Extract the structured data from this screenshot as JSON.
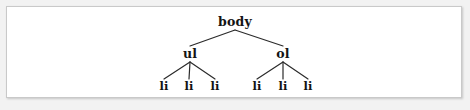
{
  "figure": {
    "title": "",
    "background_color": "#f2f2f2",
    "panel_color": "#ffffff",
    "border_color": "#c9c9c9",
    "edge_color": "#2b2b2b",
    "text_color": "#141414"
  },
  "chart_data": {
    "type": "diagram",
    "diagram_kind": "tree",
    "title": "",
    "nodes": [
      {
        "id": "body",
        "label": "body",
        "level": 0,
        "x": 235,
        "y": 22,
        "parent": null
      },
      {
        "id": "ul",
        "label": "ul",
        "level": 1,
        "x": 190,
        "y": 54,
        "parent": "body"
      },
      {
        "id": "ol",
        "label": "ol",
        "level": 1,
        "x": 283,
        "y": 54,
        "parent": "body"
      },
      {
        "id": "li-u1",
        "label": "li",
        "level": 2,
        "x": 164,
        "y": 87,
        "parent": "ul"
      },
      {
        "id": "li-u2",
        "label": "li",
        "level": 2,
        "x": 189,
        "y": 87,
        "parent": "ul"
      },
      {
        "id": "li-u3",
        "label": "li",
        "level": 2,
        "x": 215,
        "y": 87,
        "parent": "ul"
      },
      {
        "id": "li-o1",
        "label": "li",
        "level": 2,
        "x": 257,
        "y": 87,
        "parent": "ol"
      },
      {
        "id": "li-o2",
        "label": "li",
        "level": 2,
        "x": 283,
        "y": 87,
        "parent": "ol"
      },
      {
        "id": "li-o3",
        "label": "li",
        "level": 2,
        "x": 308,
        "y": 87,
        "parent": "ol"
      }
    ],
    "edges": [
      {
        "from": "body",
        "to": "ul"
      },
      {
        "from": "body",
        "to": "ol"
      },
      {
        "from": "ul",
        "to": "li-u1"
      },
      {
        "from": "ul",
        "to": "li-u2"
      },
      {
        "from": "ul",
        "to": "li-u3"
      },
      {
        "from": "ol",
        "to": "li-o1"
      },
      {
        "from": "ol",
        "to": "li-o2"
      },
      {
        "from": "ol",
        "to": "li-o3"
      }
    ]
  }
}
